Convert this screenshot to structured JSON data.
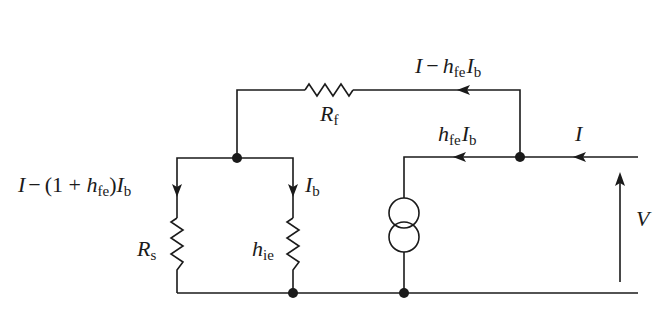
{
  "diagram": {
    "type": "small-signal equivalent circuit",
    "labels": {
      "feedback_resistor": {
        "main": "R",
        "sub": "f"
      },
      "source_resistor": {
        "main": "R",
        "sub": "s"
      },
      "input_resistance": {
        "main": "h",
        "sub": "ie"
      },
      "voltage": "V",
      "input_current": "I",
      "base_current": {
        "main": "I",
        "sub": "b"
      },
      "controlled_current": {
        "h": "h",
        "h_sub": "fe",
        "I": "I",
        "I_sub": "b"
      },
      "feedback_current": {
        "I": "I",
        "minus": "−",
        "h": "h",
        "h_sub": "fe",
        "Ib": "I",
        "Ib_sub": "b"
      },
      "source_branch_current": {
        "I": "I",
        "minus": "−",
        "open": "(1 + ",
        "h": "h",
        "h_sub": "fe",
        "close": ")",
        "Ib": "I",
        "Ib_sub": "b"
      }
    },
    "components": [
      "R_f",
      "R_s",
      "h_ie",
      "dependent current source h_fe I_b"
    ],
    "nodes": 4
  }
}
